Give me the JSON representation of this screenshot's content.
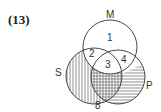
{
  "problem_number": "(13)",
  "circles": [
    {
      "label": "M"
    },
    {
      "label": "S"
    },
    {
      "label": "P"
    }
  ],
  "regions": [
    "1",
    "2",
    "3",
    "4",
    "8"
  ],
  "shading": {
    "S_only": "vertical",
    "S_and_P_not_M": "cross",
    "P_only_lower": "horizontal"
  }
}
